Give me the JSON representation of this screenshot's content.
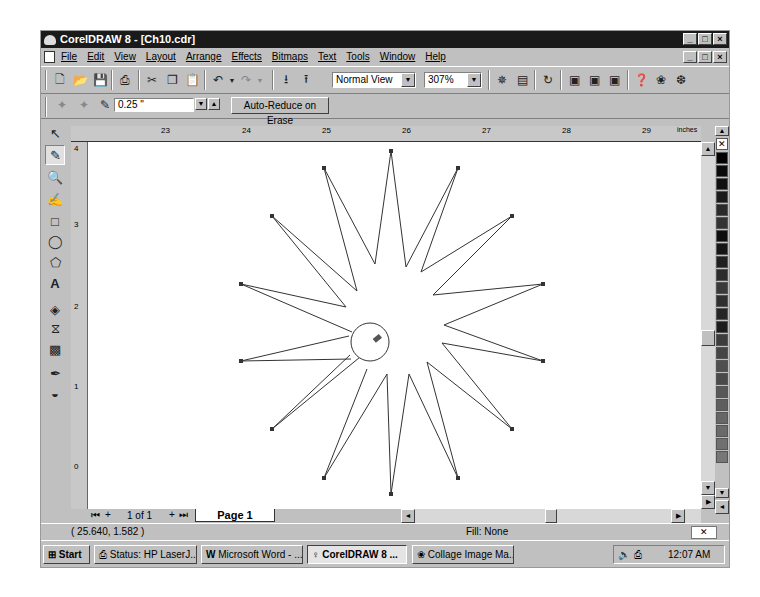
{
  "window": {
    "title": "CorelDRAW 8 - [Ch10.cdr]",
    "controls": [
      "_",
      "□",
      "×"
    ]
  },
  "menubar": {
    "items": [
      "File",
      "Edit",
      "View",
      "Layout",
      "Arrange",
      "Effects",
      "Bitmaps",
      "Text",
      "Tools",
      "Window",
      "Help"
    ]
  },
  "toolbar": {
    "view_mode": "Normal View",
    "zoom_level": "307%"
  },
  "property_bar": {
    "eraser_thickness": "0.25 \"",
    "auto_reduce_label": "Auto-Reduce on Erase"
  },
  "rulers": {
    "horizontal_ticks": [
      "23",
      "24",
      "25",
      "26",
      "27",
      "28",
      "29"
    ],
    "horizontal_unit": "inches",
    "vertical_ticks": [
      "4",
      "3",
      "2",
      "1",
      "0"
    ],
    "vertical_unit": "inches"
  },
  "toolbox": {
    "tools": [
      "pick-tool",
      "eraser-tool",
      "zoom-tool",
      "freehand-tool",
      "rectangle-tool",
      "ellipse-tool",
      "polygon-tool",
      "text-tool",
      "interactive-fill-tool",
      "interactive-blend-tool",
      "interactive-transparency-tool",
      "outline-tool",
      "fill-tool"
    ],
    "active": "eraser-tool"
  },
  "page_nav": {
    "page_count": "1 of 1",
    "tab_label": "Page 1"
  },
  "status": {
    "coordinates": "( 25.640, 1.582 )",
    "fill": "Fill: None"
  },
  "palette": {
    "colors": [
      "#000000",
      "#0a0a0a",
      "#111111",
      "#1a1a1a",
      "#2a2a2a",
      "#333333",
      "#0d0d0d",
      "#151515",
      "#202020",
      "#2c2c2c",
      "#3a3a3a",
      "#303030",
      "#252525",
      "#1c1c1c",
      "#3d3d3d",
      "#454545",
      "#505050",
      "#4a4a4a",
      "#585858",
      "#5e5e5e",
      "#666666",
      "#6a6a6a",
      "#707070",
      "#777777"
    ]
  },
  "taskbar": {
    "start_label": "Start",
    "tasks": [
      {
        "label": "Status: HP LaserJ...",
        "active": false
      },
      {
        "label": "Microsoft Word - ...",
        "active": false
      },
      {
        "label": "CorelDRAW 8 ...",
        "active": true
      },
      {
        "label": "Collage Image Ma...",
        "active": false
      }
    ],
    "clock": "12:07 AM"
  }
}
